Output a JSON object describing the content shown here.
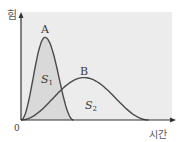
{
  "chart_data": {
    "type": "line",
    "title": "",
    "xlabel": "시간",
    "ylabel": "힘",
    "origin_label": "0",
    "xlim": [
      0,
      1
    ],
    "ylim": [
      0,
      1
    ],
    "grid": false,
    "series": [
      {
        "name": "A",
        "area_label": "S",
        "area_subscript": "1",
        "peak": {
          "x": 0.16,
          "y": 0.78
        },
        "end_x": 0.35,
        "shape": "narrow-tall pulse"
      },
      {
        "name": "B",
        "area_label": "S",
        "area_subscript": "2",
        "peak": {
          "x": 0.42,
          "y": 0.4
        },
        "end_x": 0.85,
        "shape": "wide-low pulse"
      }
    ]
  },
  "colors": {
    "plot_bg": "#ececec",
    "area_s1": "#d9d9d9",
    "curve": "#4a4a4a",
    "axis": "#333333"
  }
}
